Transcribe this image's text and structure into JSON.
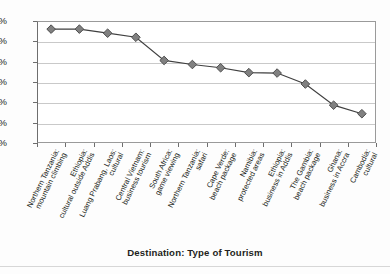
{
  "chart_data": {
    "type": "line",
    "title": "",
    "xlabel": "Destination: Type of Tourism",
    "ylabel": "",
    "ylim": [
      0,
      30
    ],
    "ytick_labels": [
      "0%",
      "5%",
      "10%",
      "15%",
      "20%",
      "25%",
      "30%"
    ],
    "ytick_values": [
      0,
      5,
      10,
      15,
      20,
      25,
      30
    ],
    "grid": true,
    "legend": "none",
    "marker": "diamond",
    "marker_color": "#808080",
    "marker_edge_color": "#4d4d4d",
    "line_color": "#3f3f3f",
    "categories": [
      "Northern Tanzania: mountain climbing",
      "Ethiopia: cultural outside Addis",
      "Luang Prabang, Laos: cultural",
      "Central Vietnam: business tourism",
      "South Africa: game viewing",
      "Northern Tanzania: safari",
      "Cape Verde: beach package",
      "Namibia: protected areas",
      "Ethiopia: business in Addis",
      "The Gambia: beach package",
      "Ghana: business in Accra",
      "Cambodia: cultural"
    ],
    "values": [
      28.0,
      28.0,
      27.0,
      26.0,
      20.3,
      19.3,
      18.5,
      17.3,
      17.2,
      14.5,
      9.3,
      7.2
    ]
  },
  "category_label_lines": [
    [
      "Northern Tanzania:",
      "mountain climbing"
    ],
    [
      "Ethiopia:",
      "cultural outside Addis"
    ],
    [
      "Luang Prabang, Laos:",
      "cultural"
    ],
    [
      "Central Vietnam:",
      "business tourism"
    ],
    [
      "South Africa:",
      "game viewing"
    ],
    [
      "Northern Tanzania:",
      "safari"
    ],
    [
      "Cape Verde:",
      "beach package"
    ],
    [
      "Namibia:",
      "protected areas"
    ],
    [
      "Ethiopia:",
      "business in Addis"
    ],
    [
      "The Gambia:",
      "beach package"
    ],
    [
      "Ghana:",
      "business in Accra"
    ],
    [
      "Cambodia:",
      "cultural"
    ]
  ]
}
